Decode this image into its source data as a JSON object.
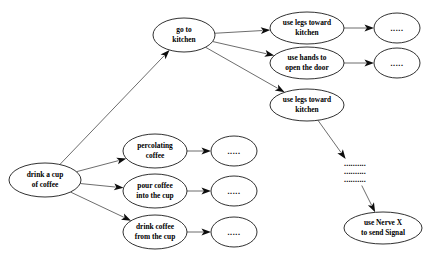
{
  "diagram": {
    "background_color": "#ffffff",
    "node_fill": "#ffffff",
    "node_stroke": "#1a1a1a",
    "edge_color": "#3c3c3c",
    "arrow_color": "#0d0d0d",
    "nodes": [
      {
        "id": "root",
        "label": "drink a cup of coffee",
        "line1": "drink a cup",
        "line2": "of coffee",
        "cx": 45,
        "cy": 180,
        "rx": 36,
        "ry": 17
      },
      {
        "id": "go-to-kitchen",
        "label": "go to kitchen",
        "line1": "go to",
        "line2": "kitchen",
        "cx": 184,
        "cy": 35,
        "rx": 31,
        "ry": 17
      },
      {
        "id": "percolating-coffee",
        "label": "percolating coffee",
        "line1": "percolating",
        "line2": "coffee",
        "cx": 155,
        "cy": 151,
        "rx": 32,
        "ry": 17
      },
      {
        "id": "pour-coffee",
        "label": "pour coffee into the cup",
        "line1": "pour coffee",
        "line2": "into the cup",
        "cx": 155,
        "cy": 191,
        "rx": 32,
        "ry": 17
      },
      {
        "id": "drink-coffee",
        "label": "drink coffee from the cup",
        "line1": "drink coffee",
        "line2": "from the cup",
        "cx": 155,
        "cy": 232,
        "rx": 32,
        "ry": 17
      },
      {
        "id": "use-legs-kitchen-1",
        "label": "use legs toward kitchen",
        "line1": "use legs toward",
        "line2": "kitchen",
        "cx": 307,
        "cy": 28,
        "rx": 37,
        "ry": 16
      },
      {
        "id": "use-hands-door",
        "label": "use hands to open the door",
        "line1": "use hands to",
        "line2": "open the door",
        "cx": 307,
        "cy": 63,
        "rx": 37,
        "ry": 16
      },
      {
        "id": "use-legs-kitchen-2",
        "label": "use legs toward kitchen",
        "line1": "use legs toward",
        "line2": "kitchen",
        "cx": 307,
        "cy": 105,
        "rx": 37,
        "ry": 16
      },
      {
        "id": "use-nerve-x",
        "label": "use Nerve X to send Signal",
        "line1": "use Nerve X",
        "line2": "to send Signal",
        "cx": 383,
        "cy": 228,
        "rx": 39,
        "ry": 16
      },
      {
        "id": "ellipsis-percolating",
        "label": ".....",
        "line1": ".....",
        "line2": "",
        "cx": 234,
        "cy": 151,
        "rx": 23,
        "ry": 15
      },
      {
        "id": "ellipsis-pour",
        "label": ".....",
        "line1": ".....",
        "line2": "",
        "cx": 234,
        "cy": 191,
        "rx": 23,
        "ry": 15
      },
      {
        "id": "ellipsis-drink",
        "label": ".....",
        "line1": ".....",
        "line2": "",
        "cx": 234,
        "cy": 232,
        "rx": 23,
        "ry": 15
      },
      {
        "id": "ellipsis-use-legs",
        "label": ".....",
        "line1": ".....",
        "line2": "",
        "cx": 397,
        "cy": 28,
        "rx": 23,
        "ry": 15
      },
      {
        "id": "ellipsis-use-hands",
        "label": ".....",
        "line1": ".....",
        "line2": "",
        "cx": 397,
        "cy": 63,
        "rx": 23,
        "ry": 15
      }
    ],
    "continuation_marker": {
      "id": "vertical-ellipsis",
      "rows": [
        "..........",
        "..........",
        ".........."
      ],
      "cx": 355,
      "cy": 172
    },
    "edges": [
      {
        "from": "root",
        "to": "go-to-kitchen"
      },
      {
        "from": "root",
        "to": "percolating-coffee"
      },
      {
        "from": "root",
        "to": "pour-coffee"
      },
      {
        "from": "root",
        "to": "drink-coffee"
      },
      {
        "from": "go-to-kitchen",
        "to": "use-legs-kitchen-1"
      },
      {
        "from": "go-to-kitchen",
        "to": "use-hands-door"
      },
      {
        "from": "go-to-kitchen",
        "to": "use-legs-kitchen-2"
      },
      {
        "from": "percolating-coffee",
        "to": "ellipsis-percolating"
      },
      {
        "from": "pour-coffee",
        "to": "ellipsis-pour"
      },
      {
        "from": "drink-coffee",
        "to": "ellipsis-drink"
      },
      {
        "from": "use-legs-kitchen-1",
        "to": "ellipsis-use-legs"
      },
      {
        "from": "use-hands-door",
        "to": "ellipsis-use-hands"
      },
      {
        "from": "use-legs-kitchen-2",
        "to": "vertical-ellipsis"
      },
      {
        "from": "vertical-ellipsis",
        "to": "use-nerve-x"
      }
    ]
  }
}
